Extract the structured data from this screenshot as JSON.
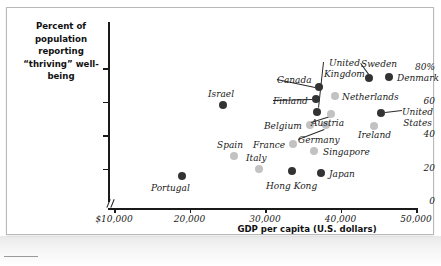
{
  "figure": {
    "y_axis_title": "Percent of population\nreporting “thriving”\nwell-being",
    "x_axis_title": "GDP per capita (U.S. dollars)"
  },
  "chart_data": {
    "type": "scatter",
    "title": "",
    "xlabel": "GDP per capita (U.S. dollars)",
    "ylabel": "Percent of population reporting “thriving” well-being",
    "xlim": [
      10000,
      50000
    ],
    "ylim": [
      0,
      80
    ],
    "grid": false,
    "legend": "none",
    "axis_break_y": true,
    "xticks": [
      10000,
      20000,
      30000,
      40000,
      50000
    ],
    "xticklabels": [
      "$10,000",
      "20,000",
      "30,000",
      "40,000",
      "50,000"
    ],
    "yticks": [
      0,
      20,
      40,
      60,
      80
    ],
    "yticklabels": [
      "0",
      "20",
      "40",
      "60",
      "80%"
    ],
    "points": [
      {
        "label": "Portugal",
        "x": 19500,
        "y": 18,
        "shade": "dark",
        "px": 181,
        "py": 175,
        "lx": 150,
        "ly": 182,
        "leader": false
      },
      {
        "label": "Israel",
        "x": 23800,
        "y": 59,
        "shade": "dark",
        "px": 222,
        "py": 104,
        "lx": 207,
        "ly": 88,
        "leader": false
      },
      {
        "label": "Spain",
        "x": 25200,
        "y": 27,
        "shade": "light",
        "px": 233,
        "py": 155,
        "lx": 216,
        "ly": 139,
        "leader": false
      },
      {
        "label": "Italy",
        "x": 28500,
        "y": 20,
        "shade": "light",
        "px": 258,
        "py": 168,
        "lx": 245,
        "ly": 152,
        "leader": false
      },
      {
        "label": "Hong Kong",
        "x": 32800,
        "y": 19,
        "shade": "dark",
        "px": 291,
        "py": 170,
        "lx": 265,
        "ly": 180,
        "leader": false
      },
      {
        "label": "France",
        "x": 33000,
        "y": 34,
        "shade": "light",
        "px": 292,
        "py": 143,
        "lx": 252,
        "ly": 139,
        "leader": false
      },
      {
        "label": "Singapore",
        "x": 35400,
        "y": 30,
        "shade": "light",
        "px": 313,
        "py": 150,
        "lx": 322,
        "ly": 146,
        "leader": false
      },
      {
        "label": "Japan",
        "x": 36400,
        "y": 18,
        "shade": "dark",
        "px": 320,
        "py": 172,
        "lx": 328,
        "ly": 168,
        "leader": false
      },
      {
        "label": "Belgium",
        "x": 36500,
        "y": 42,
        "shade": "light",
        "px": 309,
        "py": 124,
        "lx": 263,
        "ly": 120,
        "leader": false
      },
      {
        "label": "Germany",
        "x": 38000,
        "y": 42,
        "shade": "light",
        "px": 325,
        "py": 124,
        "lx": 297,
        "ly": 134,
        "leader": true,
        "tx": 323,
        "ty": 128
      },
      {
        "label": "United\nKingdom",
        "x": 37700,
        "y": 52,
        "shade": "dark",
        "px": 316,
        "py": 111,
        "lx": 323,
        "ly": 57,
        "leader": true,
        "tx": 318,
        "ty": 107
      },
      {
        "label": "Finland",
        "x": 37500,
        "y": 59,
        "shade": "dark",
        "px": 315,
        "py": 98,
        "lx": 272,
        "ly": 95,
        "leader": true,
        "tx": 311,
        "ty": 98
      },
      {
        "label": "Canada",
        "x": 38000,
        "y": 65,
        "shade": "dark",
        "px": 318,
        "py": 86,
        "lx": 276,
        "ly": 74,
        "leader": true,
        "tx": 314,
        "ty": 86
      },
      {
        "label": "Netherlands",
        "x": 39000,
        "y": 56,
        "shade": "light",
        "px": 334,
        "py": 95,
        "lx": 341,
        "ly": 91,
        "leader": false
      },
      {
        "label": "Austria",
        "x": 38600,
        "y": 50,
        "shade": "light",
        "px": 330,
        "py": 113,
        "lx": 310,
        "ly": 117,
        "leader": true,
        "tx": 329,
        "ty": 115
      },
      {
        "label": "Sweden",
        "x": 41500,
        "y": 72,
        "shade": "dark",
        "px": 368,
        "py": 77,
        "lx": 360,
        "ly": 58,
        "leader": true,
        "tx": 368,
        "ty": 73
      },
      {
        "label": "Denmark",
        "x": 44000,
        "y": 72,
        "shade": "dark",
        "px": 388,
        "py": 76,
        "lx": 396,
        "ly": 72,
        "leader": false
      },
      {
        "label": "Ireland",
        "x": 45000,
        "y": 45,
        "shade": "light",
        "px": 373,
        "py": 125,
        "lx": 357,
        "ly": 129,
        "leader": false
      },
      {
        "label": "United\nStates",
        "x": 45800,
        "y": 53,
        "shade": "dark",
        "px": 380,
        "py": 112,
        "lx": 401,
        "ly": 106,
        "leader": true,
        "tx": 384,
        "ty": 112
      }
    ]
  }
}
